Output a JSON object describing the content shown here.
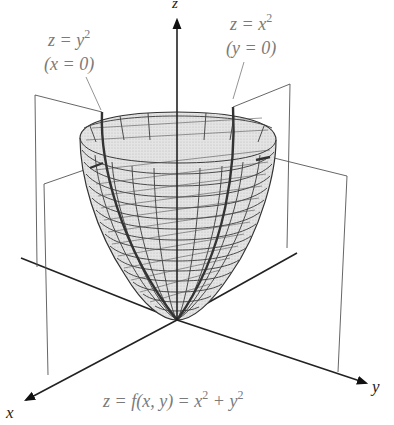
{
  "figure": {
    "type": "3d-surface-plot",
    "surface": "paraboloid",
    "equation": "z = f(x, y) = x² + y²",
    "equation_parts": {
      "prefix": "z = f(x, y) = x",
      "sup1": "2",
      "mid": " + y",
      "sup2": "2"
    }
  },
  "axes": {
    "x": {
      "label": "x"
    },
    "y": {
      "label": "y"
    },
    "z": {
      "label": "z"
    }
  },
  "annotations": [
    {
      "id": "trace-x0",
      "line1_base": "z = y",
      "line1_sup": "2",
      "line2": "(x = 0)"
    },
    {
      "id": "trace-y0",
      "line1_base": "z = x",
      "line1_sup": "2",
      "line2": "(y = 0)"
    }
  ],
  "colors": {
    "surface_fill": "#dcdcdc",
    "mesh": "#3a3a3a",
    "axis": "#222222",
    "label_gray": "#7a7a7a",
    "background": "#ffffff"
  }
}
